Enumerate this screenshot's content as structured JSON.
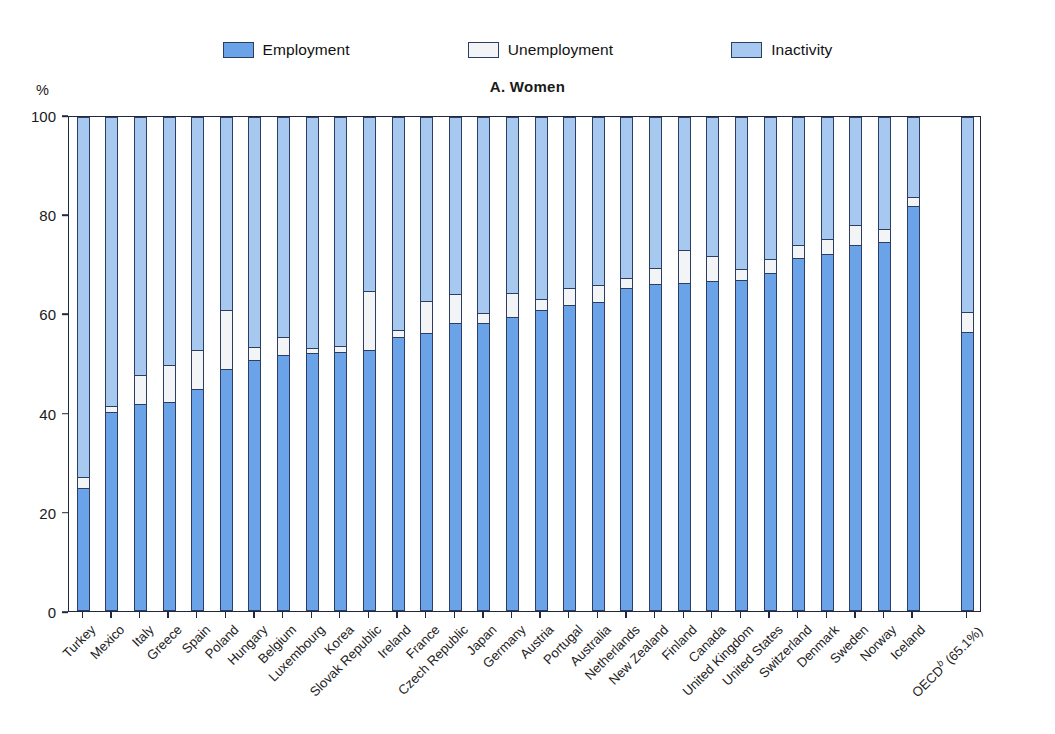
{
  "chart_title": "A. Women",
  "unit_label": "%",
  "legend": {
    "items": [
      {
        "label": "Employment",
        "color": "#6ba3e8",
        "swatch_name": "legend-swatch-employment"
      },
      {
        "label": "Unemployment",
        "color": "#f2f4f5",
        "swatch_name": "legend-swatch-unemployment"
      },
      {
        "label": "Inactivity",
        "color": "#a8c9ef",
        "swatch_name": "legend-swatch-inactivity"
      }
    ]
  },
  "colors": {
    "employment": "#6ba3e8",
    "unemployment": "#f2f4f5",
    "inactivity": "#a8c9ef",
    "outline": "#2c3e63",
    "axis": "#20293f",
    "background": "#ffffff"
  },
  "chart_data": {
    "type": "bar",
    "subtype": "stacked-bar-100-percent",
    "title": "A. Women",
    "xlabel": "",
    "ylabel": "%",
    "ylim": [
      0,
      100
    ],
    "yticks": [
      0,
      20,
      40,
      60,
      80,
      100
    ],
    "grid": false,
    "legend_position": "top-center",
    "categories": [
      "Turkey",
      "Mexico",
      "Italy",
      "Greece",
      "Spain",
      "Poland",
      "Hungary",
      "Belgium",
      "Luxembourg",
      "Korea",
      "Slovak Republic",
      "Ireland",
      "France",
      "Czech Republic",
      "Japan",
      "Germany",
      "Austria",
      "Portugal",
      "Australia",
      "Netherlands",
      "New Zealand",
      "Finland",
      "Canada",
      "United Kingdom",
      "United States",
      "Switzerland",
      "Denmark",
      "Sweden",
      "Norway",
      "Iceland",
      "OECD (65.1%)"
    ],
    "series": [
      {
        "name": "Employment",
        "values": [
          24.5,
          40.0,
          41.5,
          42.0,
          44.5,
          48.5,
          50.5,
          51.5,
          51.8,
          52.0,
          52.5,
          55.0,
          55.8,
          57.8,
          57.8,
          59.0,
          60.5,
          61.5,
          62.0,
          65.0,
          65.8,
          66.0,
          66.3,
          66.5,
          68.0,
          71.0,
          71.8,
          73.5,
          74.2,
          81.5,
          56.0
        ]
      },
      {
        "name": "Unemployment",
        "values": [
          2.3,
          1.2,
          5.8,
          7.5,
          8.0,
          12.0,
          2.5,
          3.5,
          1.0,
          1.3,
          11.8,
          1.5,
          6.5,
          6.0,
          2.0,
          5.0,
          2.3,
          3.5,
          3.5,
          2.0,
          3.2,
          6.5,
          5.0,
          2.2,
          2.8,
          2.5,
          3.0,
          4.2,
          2.6,
          1.8,
          4.0
        ]
      },
      {
        "name": "Inactivity",
        "values": [
          73.2,
          58.8,
          52.7,
          50.5,
          47.5,
          39.5,
          47.0,
          45.0,
          47.2,
          46.7,
          35.7,
          43.5,
          37.7,
          36.2,
          40.2,
          36.0,
          37.2,
          35.0,
          34.5,
          33.0,
          31.0,
          27.5,
          28.7,
          31.3,
          29.2,
          26.5,
          25.2,
          22.3,
          23.2,
          16.7,
          40.0
        ]
      }
    ],
    "notes": {
      "oecd_footnote_marker": "b",
      "oecd_label_full": "OECDᵇ (65.1%)",
      "separated_last_bar": true
    }
  }
}
